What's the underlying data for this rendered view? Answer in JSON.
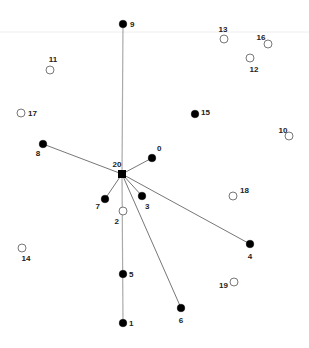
{
  "diagram": {
    "type": "star-network",
    "colors": {
      "background": "#ffffff",
      "filled_node": "#000000",
      "open_node_stroke": "#555555",
      "edge": "#666666",
      "vertical_edge": "#aaaaaa",
      "guide_line": "#eeeeee",
      "label": "#222222"
    },
    "hub": {
      "id": "20",
      "label": "20",
      "x": 122,
      "y": 174,
      "shape": "square"
    },
    "nodes": [
      {
        "id": "0",
        "label": "0",
        "x": 152,
        "y": 158,
        "filled": true,
        "lx": 157,
        "ly": 151,
        "anchor": "start"
      },
      {
        "id": "1",
        "label": "1",
        "x": 123,
        "y": 323,
        "filled": true,
        "lx": 129,
        "ly": 326,
        "anchor": "start"
      },
      {
        "id": "2",
        "label": "2",
        "x": 123,
        "y": 211,
        "filled": false,
        "lx": 119,
        "ly": 224,
        "anchor": "end"
      },
      {
        "id": "3",
        "label": "3",
        "x": 142,
        "y": 196,
        "filled": true,
        "lx": 145,
        "ly": 209,
        "anchor": "start"
      },
      {
        "id": "4",
        "label": "4",
        "x": 250,
        "y": 244,
        "filled": true,
        "lx": 250,
        "ly": 259,
        "anchor": "middle"
      },
      {
        "id": "5",
        "label": "5",
        "x": 123,
        "y": 274,
        "filled": true,
        "lx": 129,
        "ly": 277,
        "anchor": "start"
      },
      {
        "id": "6",
        "label": "6",
        "x": 181,
        "y": 308,
        "filled": true,
        "lx": 181,
        "ly": 323,
        "anchor": "middle"
      },
      {
        "id": "7",
        "label": "7",
        "x": 105,
        "y": 199,
        "filled": true,
        "lx": 100,
        "ly": 209,
        "anchor": "end"
      },
      {
        "id": "8",
        "label": "8",
        "x": 43,
        "y": 144,
        "filled": true,
        "lx": 38,
        "ly": 156,
        "anchor": "middle"
      },
      {
        "id": "9",
        "label": "9",
        "x": 123,
        "y": 24,
        "filled": true,
        "lx": 130,
        "ly": 27,
        "anchor": "start"
      },
      {
        "id": "10",
        "label": "10",
        "x": 289,
        "y": 136,
        "filled": false,
        "lx": 283,
        "ly": 133,
        "anchor": "middle"
      },
      {
        "id": "11",
        "label": "11",
        "x": 50,
        "y": 70,
        "filled": false,
        "lx": 53,
        "ly": 62,
        "anchor": "middle"
      },
      {
        "id": "12",
        "label": "12",
        "x": 250,
        "y": 58,
        "filled": false,
        "lx": 254,
        "ly": 72,
        "anchor": "middle"
      },
      {
        "id": "13",
        "label": "13",
        "x": 224,
        "y": 39,
        "filled": false,
        "lx": 223,
        "ly": 32,
        "anchor": "middle"
      },
      {
        "id": "14",
        "label": "14",
        "x": 22,
        "y": 248,
        "filled": false,
        "lx": 26,
        "ly": 261,
        "anchor": "middle"
      },
      {
        "id": "15",
        "label": "15",
        "x": 195,
        "y": 114,
        "filled": true,
        "lx": 201,
        "ly": 115,
        "anchor": "start"
      },
      {
        "id": "16",
        "label": "16",
        "x": 268,
        "y": 44,
        "filled": false,
        "lx": 261,
        "ly": 40,
        "anchor": "middle"
      },
      {
        "id": "17",
        "label": "17",
        "x": 21,
        "y": 113,
        "filled": false,
        "lx": 28,
        "ly": 116,
        "anchor": "start"
      },
      {
        "id": "18",
        "label": "18",
        "x": 233,
        "y": 196,
        "filled": false,
        "lx": 240,
        "ly": 193,
        "anchor": "start"
      },
      {
        "id": "19",
        "label": "19",
        "x": 234,
        "y": 282,
        "filled": false,
        "lx": 228,
        "ly": 288,
        "anchor": "end"
      }
    ],
    "edges": [
      {
        "from": "20",
        "to": "9",
        "style": "vertical"
      },
      {
        "from": "20",
        "to": "1",
        "style": "vertical"
      },
      {
        "from": "20",
        "to": "8",
        "style": "solid"
      },
      {
        "from": "20",
        "to": "0",
        "style": "solid"
      },
      {
        "from": "20",
        "to": "7",
        "style": "solid"
      },
      {
        "from": "20",
        "to": "3",
        "style": "solid"
      },
      {
        "from": "20",
        "to": "4",
        "style": "solid"
      },
      {
        "from": "20",
        "to": "6",
        "style": "solid"
      }
    ],
    "guide_line_y": 32
  }
}
